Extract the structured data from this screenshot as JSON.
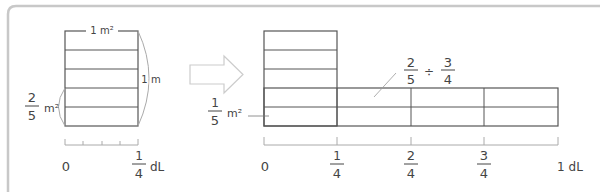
{
  "left_diagram": {
    "top_label": "1 m²",
    "side_label": "1 m",
    "fraction_label": {
      "numerator": "2",
      "denominator": "5",
      "unit": "m²"
    },
    "axis": {
      "start": "0",
      "end": {
        "numerator": "1",
        "denominator": "4",
        "unit": "dL"
      }
    },
    "rows": 5,
    "axis_ticks": 5
  },
  "arrow": {
    "direction": "right"
  },
  "right_diagram": {
    "fraction_label": {
      "numerator": "1",
      "denominator": "5",
      "unit": "m²"
    },
    "expression": {
      "a_num": "2",
      "a_den": "5",
      "op": "÷",
      "b_num": "3",
      "b_den": "4"
    },
    "axis": {
      "ticks": [
        {
          "label": "0"
        },
        {
          "numerator": "1",
          "denominator": "4"
        },
        {
          "numerator": "2",
          "denominator": "4"
        },
        {
          "numerator": "3",
          "denominator": "4"
        },
        {
          "label": "1 dL"
        }
      ]
    }
  },
  "colors": {
    "line": "#555555",
    "light": "#bbbbbb",
    "text": "#444444",
    "frame": "#c8c8c8"
  }
}
